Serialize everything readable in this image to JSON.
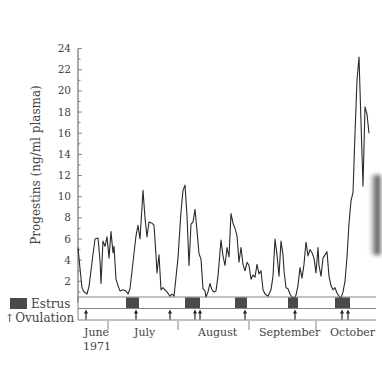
{
  "chart_data": {
    "type": "line",
    "title": "",
    "ylabel": "Progestins (ng/ml plasma)",
    "xlabel": "June 1971 – October",
    "ylim": [
      0,
      24
    ],
    "yticks": [
      2,
      4,
      6,
      8,
      10,
      12,
      14,
      16,
      18,
      20,
      22,
      24
    ],
    "grid": false,
    "months": [
      {
        "label": "June",
        "sublabel": "1971",
        "x": 82
      },
      {
        "label": "July",
        "x": 133
      },
      {
        "label": "August",
        "x": 197
      },
      {
        "label": "September",
        "x": 258
      },
      {
        "label": "October",
        "x": 331
      }
    ],
    "month_dividers_x": [
      108,
      178,
      249,
      316
    ],
    "series": [
      {
        "name": "Progestins",
        "color": "#2a2a2a",
        "points": [
          [
            78,
            5.2
          ],
          [
            80,
            3.2
          ],
          [
            82,
            1.4
          ],
          [
            84,
            1.0
          ],
          [
            87,
            0.8
          ],
          [
            89,
            1.5
          ],
          [
            92,
            3.8
          ],
          [
            95,
            6.0
          ],
          [
            98,
            6.1
          ],
          [
            100,
            4.0
          ],
          [
            101,
            1.8
          ],
          [
            103,
            5.8
          ],
          [
            105,
            5.3
          ],
          [
            107,
            6.2
          ],
          [
            109,
            4.2
          ],
          [
            111,
            6.7
          ],
          [
            113,
            4.7
          ],
          [
            114,
            5.3
          ],
          [
            116,
            2.2
          ],
          [
            118,
            1.6
          ],
          [
            120,
            1.1
          ],
          [
            123,
            1.2
          ],
          [
            126,
            1.1
          ],
          [
            128,
            0.8
          ],
          [
            130,
            1.3
          ],
          [
            133,
            3.8
          ],
          [
            136,
            6.3
          ],
          [
            138,
            7.3
          ],
          [
            140,
            6.0
          ],
          [
            142,
            9.0
          ],
          [
            143,
            10.6
          ],
          [
            145,
            8.0
          ],
          [
            147,
            6.2
          ],
          [
            149,
            7.6
          ],
          [
            152,
            7.5
          ],
          [
            154,
            7.3
          ],
          [
            156,
            4.5
          ],
          [
            157,
            2.8
          ],
          [
            159,
            4.5
          ],
          [
            161,
            1.2
          ],
          [
            163,
            1.4
          ],
          [
            167,
            1.0
          ],
          [
            170,
            0.6
          ],
          [
            172,
            0.8
          ],
          [
            174,
            0.6
          ],
          [
            178,
            4.2
          ],
          [
            181,
            8.6
          ],
          [
            183,
            10.6
          ],
          [
            185,
            11.1
          ],
          [
            187,
            8.2
          ],
          [
            189,
            3.5
          ],
          [
            191,
            7.4
          ],
          [
            193,
            7.6
          ],
          [
            195,
            8.8
          ],
          [
            197,
            6.8
          ],
          [
            199,
            4.6
          ],
          [
            201,
            4.1
          ],
          [
            203,
            1.3
          ],
          [
            205,
            1.1
          ],
          [
            206,
            0.5
          ],
          [
            208,
            1.0
          ],
          [
            210,
            1.8
          ],
          [
            212,
            1.2
          ],
          [
            214,
            1.0
          ],
          [
            216,
            1.1
          ],
          [
            218,
            2.5
          ],
          [
            221,
            5.9
          ],
          [
            223,
            4.4
          ],
          [
            225,
            3.5
          ],
          [
            227,
            5.2
          ],
          [
            229,
            4.3
          ],
          [
            231,
            8.4
          ],
          [
            233,
            7.5
          ],
          [
            235,
            7.0
          ],
          [
            237,
            6.3
          ],
          [
            239,
            3.8
          ],
          [
            241,
            5.2
          ],
          [
            243,
            3.6
          ],
          [
            245,
            3.0
          ],
          [
            247,
            3.8
          ],
          [
            249,
            3.5
          ],
          [
            251,
            2.2
          ],
          [
            253,
            2.6
          ],
          [
            255,
            2.4
          ],
          [
            257,
            3.6
          ],
          [
            259,
            2.7
          ],
          [
            261,
            3.0
          ],
          [
            263,
            1.2
          ],
          [
            265,
            0.8
          ],
          [
            268,
            0.6
          ],
          [
            271,
            1.2
          ],
          [
            273,
            2.5
          ],
          [
            275,
            6.0
          ],
          [
            277,
            4.5
          ],
          [
            279,
            2.5
          ],
          [
            281,
            5.8
          ],
          [
            283,
            4.5
          ],
          [
            284,
            3.0
          ],
          [
            286,
            1.4
          ],
          [
            288,
            1.3
          ],
          [
            290,
            0.8
          ],
          [
            292,
            0.5
          ],
          [
            294,
            0.4
          ],
          [
            296,
            0.7
          ],
          [
            298,
            1.6
          ],
          [
            300,
            3.3
          ],
          [
            302,
            2.3
          ],
          [
            304,
            3.6
          ],
          [
            306,
            5.7
          ],
          [
            308,
            4.4
          ],
          [
            310,
            5.0
          ],
          [
            312,
            4.7
          ],
          [
            314,
            4.2
          ],
          [
            316,
            2.8
          ],
          [
            318,
            5.2
          ],
          [
            319,
            3.5
          ],
          [
            321,
            2.5
          ],
          [
            323,
            4.2
          ],
          [
            325,
            4.5
          ],
          [
            327,
            4.8
          ],
          [
            329,
            2.5
          ],
          [
            331,
            1.6
          ],
          [
            333,
            1.2
          ],
          [
            335,
            1.4
          ],
          [
            337,
            0.9
          ],
          [
            339,
            0.6
          ],
          [
            341,
            0.4
          ],
          [
            343,
            1.0
          ],
          [
            345,
            2.0
          ],
          [
            347,
            4.3
          ],
          [
            349,
            7.5
          ],
          [
            351,
            9.6
          ],
          [
            353,
            10.4
          ],
          [
            355,
            16.0
          ],
          [
            357,
            21.0
          ],
          [
            359,
            23.2
          ],
          [
            361,
            17.0
          ],
          [
            363,
            11.0
          ],
          [
            365,
            18.5
          ],
          [
            367,
            17.8
          ],
          [
            369,
            16.0
          ]
        ]
      }
    ],
    "estrus_bars": [
      [
        126,
        139
      ],
      [
        185,
        200
      ],
      [
        235,
        247
      ],
      [
        288,
        298
      ],
      [
        335,
        350
      ]
    ],
    "ovulation_arrows_x": [
      86,
      136,
      170,
      195,
      200,
      245,
      295,
      342,
      348
    ]
  },
  "legend": {
    "estrus_label": "Estrus",
    "ovulation_label": "Ovulation",
    "estrus_color": "#4a4a4a"
  },
  "axes": {
    "ylabel": "Progestins (ng/ml plasma)",
    "months": [
      "June",
      "July",
      "August",
      "September",
      "October"
    ],
    "year": "1971"
  }
}
